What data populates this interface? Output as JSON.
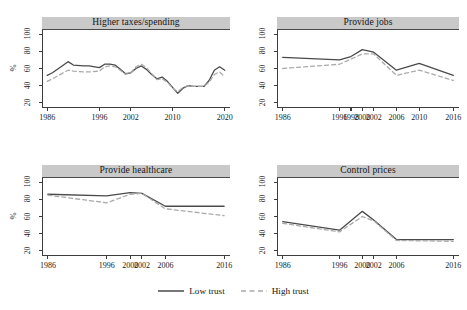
{
  "chart_data": {
    "type": "line",
    "title": "",
    "layout": "2x2 small multiples",
    "ylabel": "%",
    "xlabel": "",
    "ylim": [
      15,
      105
    ],
    "yticks": [
      20,
      40,
      60,
      80,
      100
    ],
    "grid": false,
    "legend_position": "bottom-center",
    "legend": [
      "Low trust",
      "High trust"
    ],
    "series_styles": [
      {
        "name": "Low trust",
        "dash": "solid",
        "color": "#4a4a4a"
      },
      {
        "name": "High trust",
        "dash": "dashed",
        "color": "#aaaaaa"
      }
    ],
    "panels": [
      {
        "title": "Higher taxes/spending",
        "xticks": [
          1986,
          1996,
          2002,
          2010,
          2020
        ],
        "xlim": [
          1985,
          2021
        ],
        "x": [
          1986,
          1987,
          1990,
          1991,
          1993,
          1994,
          1996,
          1997,
          1998,
          1999,
          2000,
          2001,
          2002,
          2003,
          2004,
          2005,
          2006,
          2007,
          2008,
          2009,
          2010,
          2011,
          2012,
          2013,
          2014,
          2016,
          2017,
          2018,
          2019,
          2020
        ],
        "series": [
          {
            "name": "Low trust",
            "values": [
              52,
              55,
              68,
              64,
              63,
              63,
              61,
              65,
              65,
              64,
              59,
              54,
              55,
              60,
              63,
              59,
              53,
              48,
              50,
              45,
              38,
              31,
              37,
              40,
              39,
              39,
              46,
              58,
              62,
              58
            ]
          },
          {
            "name": "High trust",
            "values": [
              45,
              48,
              58,
              57,
              56,
              56,
              57,
              62,
              63,
              62,
              58,
              53,
              55,
              62,
              65,
              61,
              54,
              47,
              48,
              44,
              37,
              33,
              38,
              40,
              39,
              39,
              44,
              53,
              56,
              50
            ]
          }
        ]
      },
      {
        "title": "Provide jobs",
        "xticks": [
          1986,
          1996,
          1998,
          2000,
          2002,
          2006,
          2010,
          2016
        ],
        "xlim": [
          1985,
          2017
        ],
        "x": [
          1986,
          1996,
          1998,
          2000,
          2002,
          2006,
          2010,
          2016
        ],
        "series": [
          {
            "name": "Low trust",
            "values": [
              73,
              70,
              74,
              82,
              79,
              58,
              66,
              52
            ]
          },
          {
            "name": "High trust",
            "values": [
              60,
              65,
              71,
              77,
              77,
              52,
              58,
              46
            ]
          }
        ]
      },
      {
        "title": "Provide healthcare",
        "xticks": [
          1986,
          1996,
          2000,
          2002,
          2006,
          2016
        ],
        "xlim": [
          1985,
          2017
        ],
        "x": [
          1986,
          1996,
          2000,
          2002,
          2006,
          2016
        ],
        "series": [
          {
            "name": "Low trust",
            "values": [
              86,
              84,
              88,
              87,
              72,
              72
            ]
          },
          {
            "name": "High trust",
            "values": [
              85,
              76,
              86,
              87,
              69,
              61
            ]
          }
        ]
      },
      {
        "title": "Control prices",
        "xticks": [
          1986,
          1996,
          2000,
          2002,
          2006,
          2016
        ],
        "xlim": [
          1985,
          2017
        ],
        "x": [
          1986,
          1996,
          2000,
          2002,
          2006,
          2016
        ],
        "series": [
          {
            "name": "Low trust",
            "values": [
              54,
              44,
              66,
              56,
              33,
              33
            ]
          },
          {
            "name": "High trust",
            "values": [
              52,
              42,
              60,
              55,
              32,
              31
            ]
          }
        ]
      }
    ]
  },
  "legend": {
    "entries": [
      {
        "label": "Low trust",
        "style": "solid"
      },
      {
        "label": "High trust",
        "style": "dashed"
      }
    ]
  },
  "axis": {
    "ylabel": "%",
    "yticks": [
      "20",
      "40",
      "60",
      "80",
      "100"
    ]
  },
  "colors": {
    "low_trust_line": "#4a4a4a",
    "high_trust_line": "#aaaaaa",
    "title_bar_bg": "#c9c9c9",
    "axis": "#3d3d3d",
    "background": "#ffffff"
  }
}
